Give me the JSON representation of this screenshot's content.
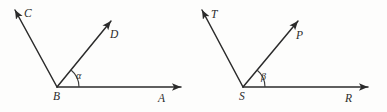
{
  "figure": {
    "background_color": "#fdfdfc",
    "line_color": "#2b2b2b",
    "width": 387,
    "height": 112
  },
  "diagrams": [
    {
      "id": "left-angle-diagram",
      "vertex": {
        "label": "B",
        "x": 57,
        "y": 87
      },
      "rays": [
        {
          "name": "ray-bc",
          "label": "C",
          "label_x": 24,
          "label_y": 12,
          "tip_x": 13,
          "tip_y": 7,
          "direction": "up-left"
        },
        {
          "name": "ray-bd",
          "label": "D",
          "label_x": 114,
          "label_y": 36,
          "tip_x": 113,
          "tip_y": 18,
          "direction": "up-right"
        },
        {
          "name": "ray-ba",
          "label": "A",
          "label_x": 161,
          "label_y": 99,
          "tip_x": 183,
          "tip_y": 87,
          "direction": "right"
        }
      ],
      "angle": {
        "name": "angle-alpha",
        "symbol": "α",
        "label_x": 78,
        "label_y": 76,
        "arc_radius": 22,
        "between": [
          "ray-ba",
          "ray-bd"
        ]
      }
    },
    {
      "id": "right-angle-diagram",
      "vertex": {
        "label": "S",
        "x": 243,
        "y": 87
      },
      "rays": [
        {
          "name": "ray-st",
          "label": "T",
          "label_x": 211,
          "label_y": 13,
          "tip_x": 200,
          "tip_y": 7,
          "direction": "up-left"
        },
        {
          "name": "ray-sp",
          "label": "P",
          "label_x": 300,
          "label_y": 37,
          "tip_x": 300,
          "tip_y": 18,
          "direction": "up-right"
        },
        {
          "name": "ray-sr",
          "label": "R",
          "label_x": 348,
          "label_y": 99,
          "tip_x": 370,
          "tip_y": 87,
          "direction": "right"
        }
      ],
      "angle": {
        "name": "angle-beta",
        "symbol": "β",
        "label_x": 263,
        "label_y": 77,
        "arc_radius": 22,
        "between": [
          "ray-sr",
          "ray-sp"
        ]
      }
    }
  ]
}
